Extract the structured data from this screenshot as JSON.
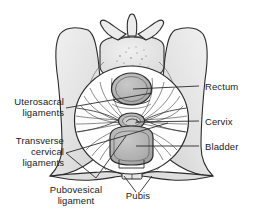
{
  "figure": {
    "background_color": "#ffffff",
    "line_color": "#1a1a1a",
    "bone_fill": "#e9e9e9",
    "organ_fill": "#b5b5b5",
    "cavity_fill": "#ffffff",
    "leader_line_color": "#2b2b2b"
  },
  "labels": {
    "uterosacral_ligaments_line1": "Uterosacral",
    "uterosacral_ligaments_line2": "ligaments",
    "transverse_cervical_line1": "Transverse",
    "transverse_cervical_line2": "cervical",
    "transverse_cervical_line3": "ligaments",
    "pubovesical_line1": "Pubovesical",
    "pubovesical_line2": "ligament",
    "rectum": "Rectum",
    "cervix": "Cervix",
    "bladder": "Bladder",
    "pubis": "Pubis"
  },
  "structures": [
    {
      "name": "sacrum-vertebra",
      "label": "sacral vertebra",
      "position": "top-center"
    },
    {
      "name": "ilium-left",
      "label": "left iliac wing",
      "position": "top-left"
    },
    {
      "name": "ilium-right",
      "label": "right iliac wing",
      "position": "top-right"
    },
    {
      "name": "rectum",
      "label": "Rectum",
      "position": "upper-center"
    },
    {
      "name": "cervix",
      "label": "Cervix",
      "position": "mid-center"
    },
    {
      "name": "bladder",
      "label": "Bladder",
      "position": "lower-center"
    },
    {
      "name": "pubis",
      "label": "Pubis",
      "position": "bottom-center"
    },
    {
      "name": "uterosacral-ligaments",
      "label": "Uterosacral ligaments",
      "position": "upper-lateral"
    },
    {
      "name": "transverse-cervical-ligaments",
      "label": "Transverse cervical ligaments",
      "position": "mid-lateral"
    },
    {
      "name": "pubovesical-ligament",
      "label": "Pubovesical ligament",
      "position": "lower-lateral"
    }
  ]
}
